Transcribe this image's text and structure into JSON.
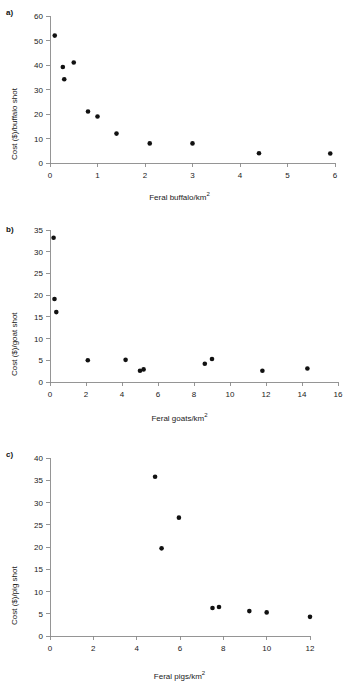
{
  "figure": {
    "background": "#ffffff",
    "point_color": "#111111",
    "axis_color": "#8a8a8a"
  },
  "panels": [
    {
      "label": "a)",
      "ylabel_main": "Cost ($)/buffalo shot",
      "xlabel_main": "Feral buffalo/km",
      "xlabel_sup": "2"
    },
    {
      "label": "b)",
      "ylabel_main": "Cost ($)/goat shot",
      "xlabel_main": "Feral goats/km",
      "xlabel_sup": "2"
    },
    {
      "label": "c)",
      "ylabel_main": "Cost ($)/pig shot",
      "xlabel_main": "Feral pigs/km",
      "xlabel_sup": "2"
    }
  ],
  "chart_data": [
    {
      "type": "scatter",
      "panel": "a)",
      "title": "",
      "xlabel": "Feral buffalo/km2",
      "ylabel": "Cost ($)/buffalo shot",
      "xlim": [
        0,
        6
      ],
      "ylim": [
        0,
        60
      ],
      "xticks": [
        0,
        1,
        2,
        3,
        4,
        5,
        6
      ],
      "yticks": [
        0,
        10,
        20,
        30,
        40,
        50,
        60
      ],
      "grid": false,
      "legend": false,
      "x": [
        0.1,
        0.27,
        0.3,
        0.5,
        0.8,
        1.0,
        1.4,
        2.1,
        3.0,
        4.4,
        5.9
      ],
      "y": [
        52.0,
        39.2,
        34.2,
        41.0,
        21.0,
        19.0,
        12.0,
        8.0,
        8.0,
        4.0,
        3.9
      ]
    },
    {
      "type": "scatter",
      "panel": "b)",
      "title": "",
      "xlabel": "Feral goats/km2",
      "ylabel": "Cost ($)/goat shot",
      "xlim": [
        0,
        16
      ],
      "ylim": [
        0,
        35
      ],
      "xticks": [
        0,
        2,
        4,
        6,
        8,
        10,
        12,
        14,
        16
      ],
      "yticks": [
        0,
        5,
        10,
        15,
        20,
        25,
        30,
        35
      ],
      "grid": false,
      "legend": false,
      "x": [
        0.2,
        0.25,
        0.35,
        2.1,
        4.2,
        5.0,
        5.2,
        8.6,
        9.0,
        11.8,
        14.3
      ],
      "y": [
        33.2,
        19.1,
        16.1,
        5.0,
        5.1,
        2.6,
        2.9,
        4.2,
        5.3,
        2.6,
        3.1
      ]
    },
    {
      "type": "scatter",
      "panel": "c)",
      "title": "",
      "xlabel": "Feral pigs/km2",
      "ylabel": "Cost ($)/pig shot",
      "xlim": [
        0,
        12
      ],
      "ylim": [
        0,
        40
      ],
      "xticks": [
        0,
        2,
        4,
        6,
        8,
        10,
        12
      ],
      "yticks": [
        0,
        5,
        10,
        15,
        20,
        25,
        30,
        35,
        40
      ],
      "grid": false,
      "legend": false,
      "x": [
        4.85,
        5.15,
        5.95,
        7.5,
        7.8,
        9.2,
        10.0,
        12.0
      ],
      "y": [
        35.8,
        19.7,
        26.6,
        6.3,
        6.5,
        5.6,
        5.3,
        4.3
      ]
    }
  ]
}
